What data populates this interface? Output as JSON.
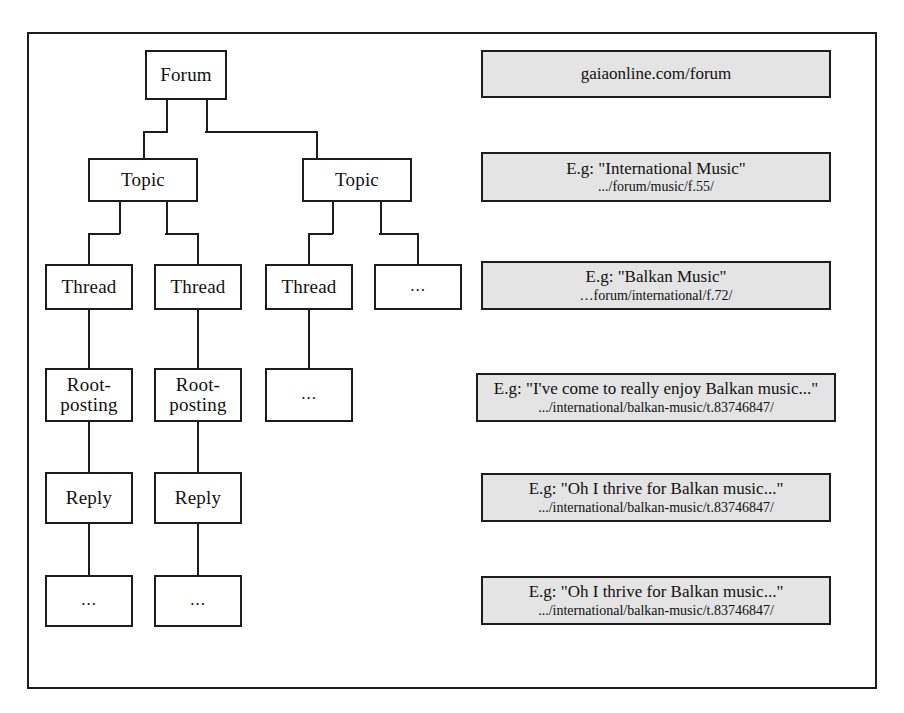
{
  "diagram": {
    "tree": {
      "forum": {
        "label": "Forum"
      },
      "topics": [
        {
          "label": "Topic"
        },
        {
          "label": "Topic"
        }
      ],
      "threads": [
        {
          "label": "Thread"
        },
        {
          "label": "Thread"
        },
        {
          "label": "Thread"
        },
        {
          "label": "..."
        }
      ],
      "rootpostings": [
        {
          "line1": "Root-",
          "line2": "posting"
        },
        {
          "line1": "Root-",
          "line2": "posting"
        },
        {
          "label": "..."
        }
      ],
      "replies": [
        {
          "label": "Reply"
        },
        {
          "label": "Reply"
        }
      ],
      "more": [
        {
          "label": "..."
        },
        {
          "label": "..."
        }
      ]
    },
    "annotations": [
      {
        "title": "gaiaonline.com/forum",
        "sub": ""
      },
      {
        "title": "E.g: \"International Music\"",
        "sub": ".../forum/music/f.55/"
      },
      {
        "title": "E.g: \"Balkan Music\"",
        "sub": "…forum/international/f.72/"
      },
      {
        "title": "E.g: \"I've come to really enjoy Balkan music...\"",
        "sub": ".../international/balkan-music/t.83746847/"
      },
      {
        "title": "E.g: \"Oh I thrive for Balkan music...\"",
        "sub": ".../international/balkan-music/t.83746847/"
      },
      {
        "title": "E.g: \"Oh I thrive for Balkan music...\"",
        "sub": ".../international/balkan-music/t.83746847/"
      }
    ],
    "colors": {
      "line": "#1c1c1c",
      "node_fill": "#ffffff",
      "annotation_fill": "#e4e4e4",
      "page_background": "#ffffff"
    }
  }
}
